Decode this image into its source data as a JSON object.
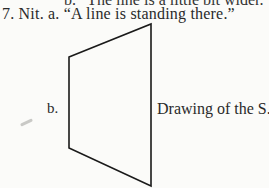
{
  "page": {
    "partial_previous_line": "b. “The line is a little bit wider.”",
    "item": {
      "number": "7.",
      "word": "Nit.",
      "sub_a_label": "a.",
      "sub_a_text": "“A line is standing there.”",
      "full_line": "7. Nit. a. “A line is standing there.”"
    },
    "figure": {
      "label": "b.",
      "caption": "Drawing of the S.",
      "shape": "quadrilateral",
      "vertices": [
        [
          69,
          57
        ],
        [
          151,
          24
        ],
        [
          151,
          186
        ],
        [
          69,
          148
        ]
      ],
      "stroke_color": "#1a1a1a"
    }
  }
}
